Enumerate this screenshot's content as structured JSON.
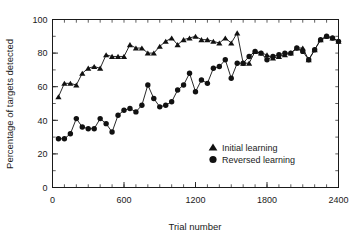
{
  "chart_data": {
    "type": "line",
    "title": "",
    "xlabel": "Trial number",
    "ylabel": "Percentage of targets detected",
    "xlim": [
      0,
      2400
    ],
    "ylim": [
      0,
      100
    ],
    "x_ticks": [
      0,
      600,
      1200,
      1800,
      2400
    ],
    "y_ticks": [
      0,
      20,
      40,
      60,
      80,
      100
    ],
    "x_minor_step": 100,
    "y_minor_step": 10,
    "grid": false,
    "legend_position": "inside-lower-right",
    "series": [
      {
        "name": "Initial learning",
        "marker": "triangle",
        "color": "#111111",
        "x": [
          50,
          100,
          150,
          200,
          250,
          300,
          350,
          400,
          450,
          500,
          550,
          600,
          650,
          700,
          750,
          800,
          850,
          900,
          950,
          1000,
          1050,
          1100,
          1150,
          1200,
          1250,
          1300,
          1350,
          1400,
          1450,
          1500,
          1550,
          1600,
          1650,
          1700,
          1750,
          1800,
          1850,
          1900,
          1950,
          2000,
          2050,
          2100,
          2150,
          2200,
          2250,
          2300,
          2350,
          2400
        ],
        "values": [
          54,
          62,
          62,
          61,
          68,
          71,
          72,
          71,
          79,
          78,
          78,
          78,
          85,
          83,
          83,
          80,
          80,
          84,
          87,
          89,
          85,
          88,
          89,
          90,
          88,
          88,
          87,
          86,
          89,
          86,
          92,
          74,
          74,
          81,
          80,
          79,
          77,
          78,
          79,
          80,
          83,
          83,
          76,
          82,
          88,
          90,
          89,
          87
        ]
      },
      {
        "name": "Reversed learning",
        "marker": "circle",
        "color": "#111111",
        "x": [
          50,
          100,
          150,
          200,
          250,
          300,
          350,
          400,
          450,
          500,
          550,
          600,
          650,
          700,
          750,
          800,
          850,
          900,
          950,
          1000,
          1050,
          1100,
          1150,
          1200,
          1250,
          1300,
          1350,
          1400,
          1450,
          1500,
          1550,
          1600,
          1650,
          1700,
          1750,
          1800,
          1850,
          1900,
          1950,
          2000,
          2050,
          2100,
          2150,
          2200,
          2250,
          2300,
          2350,
          2400
        ],
        "values": [
          29,
          29,
          32,
          41,
          36,
          35,
          35,
          41,
          38,
          33,
          43,
          46,
          47,
          45,
          49,
          61,
          53,
          48,
          49,
          51,
          58,
          61,
          68,
          57,
          64,
          62,
          71,
          72,
          76,
          65,
          74,
          74,
          78,
          81,
          80,
          76,
          78,
          79,
          80,
          80,
          83,
          81,
          76,
          82,
          88,
          90,
          89,
          87
        ]
      }
    ]
  },
  "axes": {
    "y_title": "Percentage of targets detected",
    "x_title": "Trial number",
    "x_tick_labels": [
      "0",
      "600",
      "1200",
      "1800",
      "2400"
    ],
    "y_tick_labels": [
      "0",
      "20",
      "40",
      "60",
      "80",
      "100"
    ]
  },
  "legend": {
    "entries": [
      {
        "label": "Initial learning",
        "marker": "triangle-marker-icon"
      },
      {
        "label": "Reversed learning",
        "marker": "circle-marker-icon"
      }
    ]
  }
}
